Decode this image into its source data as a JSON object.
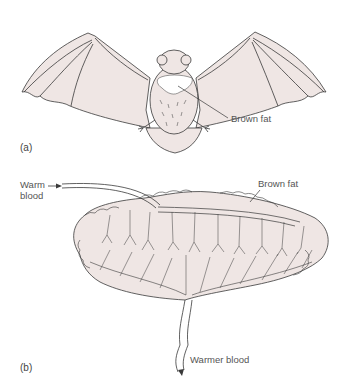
{
  "figure": {
    "panel_a": {
      "label": "(a)",
      "subject": "bat with wings spread, dorsal view",
      "callout": "Brown fat"
    },
    "panel_b": {
      "label": "(b)",
      "callouts": {
        "inflow_line1": "Warm",
        "inflow_line2": "blood",
        "tissue": "Brown fat",
        "outflow": "Warmer blood"
      }
    },
    "colors": {
      "tissue_fill": "#efe6e4",
      "outline": "#3a3a3a",
      "brown_fat_patch": "#ffffff"
    }
  }
}
